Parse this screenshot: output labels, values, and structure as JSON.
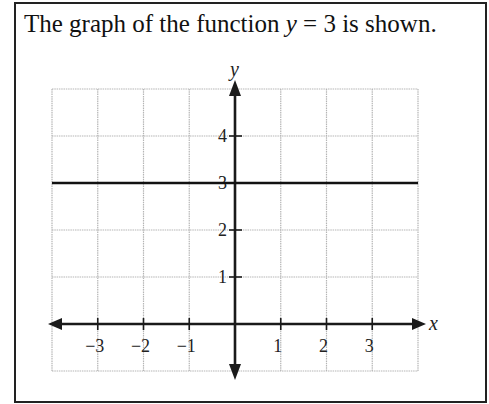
{
  "problem": {
    "text_before": "The graph of the function ",
    "variable": "y",
    "text_equation": " = 3 is shown."
  },
  "chart_data": {
    "type": "line",
    "title": "The graph of the function y = 3 is shown.",
    "xlabel": "x",
    "ylabel": "y",
    "xlim": [
      -4,
      4
    ],
    "ylim": [
      -1,
      5
    ],
    "grid": true,
    "x_ticks": [
      -3,
      -2,
      -1,
      1,
      2,
      3
    ],
    "y_ticks": [
      1,
      2,
      3,
      4
    ],
    "x_tick_labels": [
      "−3",
      "−2",
      "−1",
      "1",
      "2",
      "3"
    ],
    "y_tick_labels": [
      "1",
      "2",
      "3",
      "4"
    ],
    "series": [
      {
        "name": "y = 3",
        "x": [
          -4,
          4
        ],
        "y": [
          3,
          3
        ],
        "color": "#111111"
      }
    ]
  },
  "colors": {
    "grid": "#b5b5b5",
    "axis": "#1a1a1a",
    "line": "#111111"
  }
}
